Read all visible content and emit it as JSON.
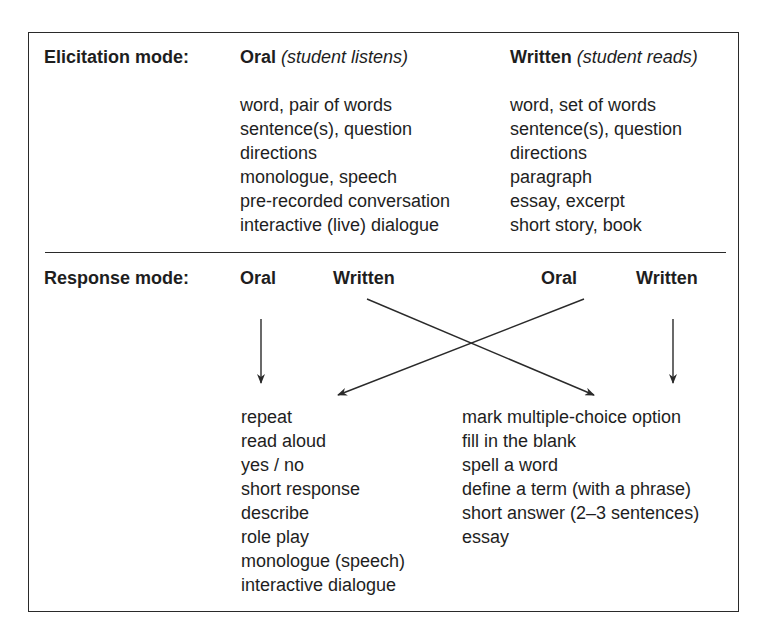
{
  "elicitation": {
    "label": "Elicitation mode:",
    "oral": {
      "title": "Oral",
      "note": "(student listens)",
      "items": [
        "word, pair of words",
        "sentence(s), question",
        "directions",
        "monologue, speech",
        "pre-recorded conversation",
        "interactive (live) dialogue"
      ]
    },
    "written": {
      "title": "Written",
      "note": "(student reads)",
      "items": [
        "word, set of words",
        "sentence(s), question",
        "directions",
        "paragraph",
        "essay, excerpt",
        "short story, book"
      ]
    }
  },
  "response": {
    "label": "Response mode:",
    "left_headers": {
      "oral": "Oral",
      "written": "Written"
    },
    "right_headers": {
      "oral": "Oral",
      "written": "Written"
    },
    "oral_items": [
      "repeat",
      "read aloud",
      "yes / no",
      "short response",
      "describe",
      "role play",
      "monologue (speech)",
      "interactive dialogue"
    ],
    "written_items": [
      "mark multiple-choice option",
      "fill in the blank",
      "spell a word",
      "define a term (with a phrase)",
      "short answer (2–3 sentences)",
      "essay"
    ]
  },
  "arrows": [
    {
      "from": "left Oral",
      "to": "oral response list"
    },
    {
      "from": "left Written",
      "to": "written response list"
    },
    {
      "from": "right Oral",
      "to": "oral response list"
    },
    {
      "from": "right Written",
      "to": "written response list"
    }
  ],
  "colors": {
    "line": "#2a2a2a",
    "text": "#1e1e1e"
  }
}
